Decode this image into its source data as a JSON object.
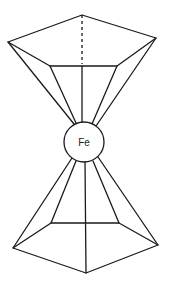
{
  "diagram": {
    "center_atom": {
      "label": "Fe",
      "cx": 84,
      "cy": 142,
      "r": 20
    },
    "top_ring": {
      "outer": [
        [
          8,
          42
        ],
        [
          82,
          15
        ],
        [
          156,
          38
        ]
      ],
      "inner": [
        [
          50,
          66
        ],
        [
          117,
          66
        ]
      ],
      "hidden_edge": [
        [
          82,
          15
        ],
        [
          82,
          64
        ]
      ],
      "center_spoke": [
        [
          82,
          66
        ],
        [
          82,
          122
        ]
      ]
    },
    "bottom_ring": {
      "outer": [
        [
          13,
          248
        ],
        [
          86,
          273
        ],
        [
          158,
          245
        ]
      ],
      "inner": [
        [
          51,
          223
        ],
        [
          119,
          223
        ]
      ],
      "center_spoke": [
        [
          85,
          162
        ],
        [
          86,
          273
        ]
      ]
    },
    "colors": {
      "line": "#1a1a1a",
      "background": "#ffffff"
    }
  }
}
